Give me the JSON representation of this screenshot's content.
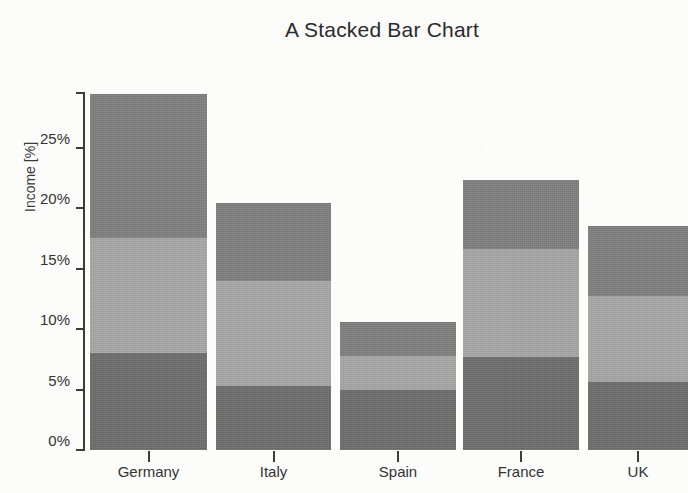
{
  "chart_data": {
    "type": "bar",
    "subtype": "stacked-bar",
    "title": "A Stacked Bar Chart",
    "xlabel": "",
    "ylabel": "Income [%]",
    "categories": [
      "Germany",
      "Italy",
      "Spain",
      "France",
      "UK"
    ],
    "series": [
      {
        "name": "bottom-segment",
        "color": "#6e6e6e",
        "values": [
          8,
          5.3,
          5,
          7.7,
          5.6
        ]
      },
      {
        "name": "middle-segment",
        "color": "#a8a8a8",
        "values": [
          9.5,
          8.7,
          2.8,
          8.9,
          7.1
        ]
      },
      {
        "name": "top-segment",
        "color": "#818181",
        "values": [
          11.9,
          6.4,
          2.8,
          5.7,
          5.8
        ]
      }
    ],
    "totals": [
      29.4,
      20.4,
      10.6,
      22.3,
      18.5
    ],
    "ylim": [
      0,
      29.6
    ],
    "yticks": [
      0,
      5,
      10,
      15,
      20,
      25
    ],
    "ytick_labels": [
      "0%",
      "5%",
      "10%",
      "15%",
      "20%",
      "25%"
    ],
    "grid": false,
    "legend": "none"
  },
  "axes": {
    "y_title": "Income [%]",
    "ticks": [
      {
        "label": "25%",
        "value": 25
      },
      {
        "label": "20%",
        "value": 20
      },
      {
        "label": "15%",
        "value": 15
      },
      {
        "label": "10%",
        "value": 10
      },
      {
        "label": "5%",
        "value": 5
      },
      {
        "label": "0%",
        "value": 0
      }
    ]
  },
  "colors": {
    "segment_bottom": "#6e6e6e",
    "segment_middle": "#a8a8a8",
    "segment_top": "#818181",
    "axis": "#3c3c3c",
    "text": "#333333",
    "background": "#fdfdfd"
  }
}
